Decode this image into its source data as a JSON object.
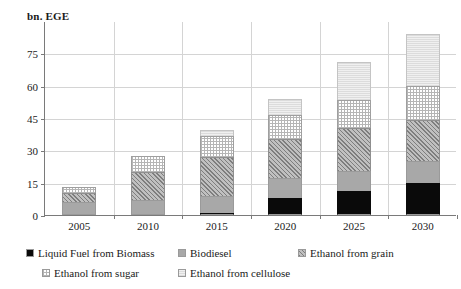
{
  "chart_data": {
    "type": "bar",
    "subtype": "stacked-column",
    "title": "",
    "ylabel": "bn. EGE",
    "xlabel": "",
    "ylim": [
      0,
      90
    ],
    "yticks": [
      0,
      15,
      30,
      45,
      60,
      75
    ],
    "grid": true,
    "legend_position": "bottom",
    "categories": [
      "2005",
      "2010",
      "2015",
      "2020",
      "2025",
      "2030"
    ],
    "series": [
      {
        "name": "Liquid Fuel from Biomass",
        "color": "#0a0a0a",
        "pattern": "solid-black",
        "values": [
          0,
          0,
          1,
          8,
          11,
          15
        ]
      },
      {
        "name": "Biodiesel",
        "color": "#a8a8a8",
        "pattern": "solid-gray",
        "values": [
          6,
          7,
          8,
          9,
          9.5,
          10
        ]
      },
      {
        "name": "Ethanol from grain",
        "color": "#c0c0c0",
        "pattern": "diagonal-hatch",
        "values": [
          4,
          13,
          18,
          18.5,
          20,
          19
        ]
      },
      {
        "name": "Ethanol from sugar",
        "color": "#ffffff",
        "pattern": "fine-dotted-grid",
        "values": [
          3,
          7.5,
          9.5,
          11,
          13,
          16
        ]
      },
      {
        "name": "Ethanol from cellulose",
        "color": "#f0f0f0",
        "pattern": "light-horizontal",
        "values": [
          0,
          0,
          3,
          7.5,
          17.5,
          24
        ]
      }
    ],
    "totals": [
      13,
      27.5,
      39.5,
      54,
      71,
      84
    ]
  },
  "legend": {
    "items": [
      {
        "label": "Liquid Fuel from Biomass",
        "fill_class": "fill-liquid"
      },
      {
        "label": "Biodiesel",
        "fill_class": "fill-biodiesel"
      },
      {
        "label": "Ethanol from grain",
        "fill_class": "fill-grain"
      },
      {
        "label": "Ethanol from sugar",
        "fill_class": "fill-sugar"
      },
      {
        "label": "Ethanol from cellulose",
        "fill_class": "fill-cellulose"
      }
    ]
  }
}
